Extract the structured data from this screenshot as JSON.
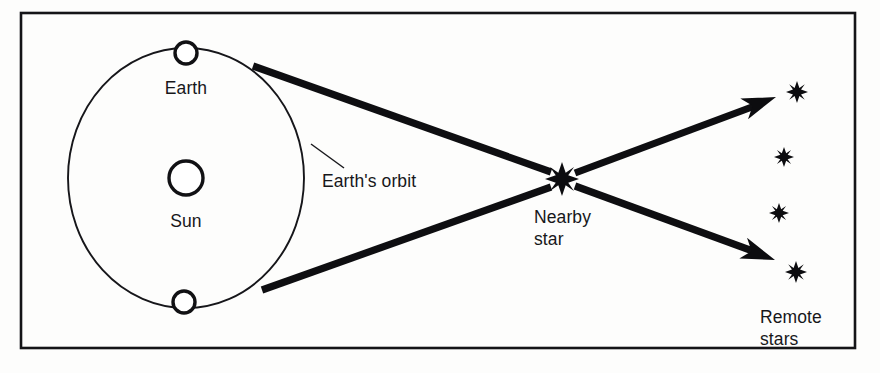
{
  "figure": {
    "width": 880,
    "height": 373,
    "background_color": "#fdfdfc",
    "ink_color": "#111114"
  },
  "frame": {
    "name": "figure-border",
    "x": 21,
    "y": 13,
    "width": 834,
    "height": 335,
    "stroke_color": "#141417"
  },
  "labels": {
    "earth": "Earth",
    "sun": "Sun",
    "earths_orbit": "Earth's orbit",
    "nearby_star_line1": "Nearby",
    "nearby_star_line2": "star",
    "remote_stars_line1": "Remote",
    "remote_stars_line2": "stars"
  },
  "bodies": {
    "orbit": {
      "cx": 186,
      "cy": 178,
      "rx": 118,
      "ry": 130
    },
    "sun": {
      "cx": 186,
      "cy": 178,
      "r": 17
    },
    "earth_top": {
      "cx": 186,
      "cy": 53,
      "r": 11
    },
    "earth_bottom": {
      "cx": 184,
      "cy": 302,
      "r": 11
    },
    "nearby_star": {
      "cx": 562,
      "cy": 179,
      "r": 17
    }
  },
  "remote_stars": [
    {
      "cx": 797,
      "cy": 92,
      "r": 11
    },
    {
      "cx": 784,
      "cy": 157,
      "r": 10
    },
    {
      "cx": 779,
      "cy": 213,
      "r": 10
    },
    {
      "cx": 796,
      "cy": 272,
      "r": 11
    }
  ],
  "sight_lines": [
    {
      "name": "upper-sight-line",
      "x1": 253,
      "y1": 66,
      "x2": 551,
      "y2": 172
    },
    {
      "name": "lower-sight-line",
      "x1": 262,
      "y1": 290,
      "x2": 551,
      "y2": 187
    },
    {
      "name": "upper-projection-line",
      "x1": 575,
      "y1": 173,
      "x2": 760,
      "y2": 104
    },
    {
      "name": "lower-projection-line",
      "x1": 575,
      "y1": 186,
      "x2": 758,
      "y2": 253
    }
  ],
  "arrow_heads": [
    {
      "name": "upper-arrowhead",
      "tip_x": 776,
      "tip_y": 97,
      "angle": -20.5
    },
    {
      "name": "lower-arrowhead",
      "tip_x": 775,
      "tip_y": 260,
      "angle": 20.5
    }
  ],
  "leader": {
    "x1": 311,
    "y1": 144,
    "x2": 344,
    "y2": 168
  },
  "label_positions": {
    "earth": {
      "x": 186,
      "y": 94
    },
    "sun": {
      "x": 186,
      "y": 227
    },
    "earths_orbit": {
      "x": 322,
      "y": 187
    },
    "nearby_star_line1": {
      "x": 534,
      "y": 223
    },
    "nearby_star_line2": {
      "x": 534,
      "y": 245
    },
    "remote_stars_line1": {
      "x": 760,
      "y": 323
    },
    "remote_stars_line2": {
      "x": 760,
      "y": 345
    }
  },
  "chart_data": {
    "type": "diagram",
    "elements": [
      {
        "id": "sun",
        "label": "Sun",
        "kind": "circle-outline",
        "x": 186,
        "y": 178
      },
      {
        "id": "earth-top",
        "label": "Earth",
        "kind": "circle-outline",
        "x": 186,
        "y": 53
      },
      {
        "id": "earth-bottom",
        "label": "Earth",
        "kind": "circle-outline",
        "x": 184,
        "y": 302
      },
      {
        "id": "earth-orbit",
        "label": "Earth's orbit",
        "kind": "ellipse",
        "x": 186,
        "y": 178
      },
      {
        "id": "nearby-star",
        "label": "Nearby star",
        "kind": "star-burst",
        "x": 562,
        "y": 179
      },
      {
        "id": "remote-star-1",
        "label": "Remote stars",
        "kind": "star-burst",
        "x": 797,
        "y": 92
      },
      {
        "id": "remote-star-2",
        "label": "Remote stars",
        "kind": "star-burst",
        "x": 784,
        "y": 157
      },
      {
        "id": "remote-star-3",
        "label": "Remote stars",
        "kind": "star-burst",
        "x": 779,
        "y": 213
      },
      {
        "id": "remote-star-4",
        "label": "Remote stars",
        "kind": "star-burst",
        "x": 796,
        "y": 272
      }
    ],
    "connections": [
      {
        "from": "earth-top",
        "through": "nearby-star",
        "to": "remote-star-1",
        "style": "thick-arrow"
      },
      {
        "from": "earth-bottom",
        "through": "nearby-star",
        "to": "remote-star-4",
        "style": "thick-arrow"
      }
    ]
  }
}
